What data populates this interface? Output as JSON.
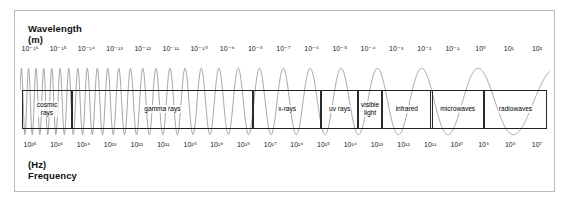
{
  "figure": {
    "background_color": "#ffffff",
    "frame_color": "#b9b9b9",
    "line_color": "#222222",
    "wave_color": "#8a8a8a"
  },
  "wavelength_axis": {
    "title_line1": "Wavelength",
    "title_line2": "(m)",
    "unit": "m",
    "ticks": [
      "10⁻¹⁶",
      "10⁻¹⁵",
      "10⁻¹⁴",
      "10⁻¹³",
      "10⁻¹²",
      "10⁻¹¹",
      "10⁻¹⁰",
      "10⁻⁹",
      "10⁻⁸",
      "10⁻⁷",
      "10⁻⁶",
      "10⁻⁵",
      "10⁻⁴",
      "10⁻³",
      "10⁻²",
      "10⁻¹",
      "10⁰",
      "10¹",
      "10²"
    ],
    "exponents": [
      -16,
      -15,
      -14,
      -13,
      -12,
      -11,
      -10,
      -9,
      -8,
      -7,
      -6,
      -5,
      -4,
      -3,
      -2,
      -1,
      0,
      1,
      2
    ]
  },
  "frequency_axis": {
    "title_line1": "(Hz)",
    "title_line2": "Frequency",
    "unit": "Hz",
    "ticks": [
      "10²⁵",
      "10²⁶",
      "10²⁴",
      "10²³",
      "10²²",
      "10²¹",
      "10²⁰",
      "10¹⁹",
      "10¹⁸",
      "10¹⁷",
      "10¹⁶",
      "10¹⁵",
      "10¹⁴",
      "10¹³",
      "10¹²",
      "10¹¹",
      "10¹⁰",
      "10⁹",
      "10⁸",
      "10⁷"
    ],
    "exponents": [
      25,
      26,
      24,
      23,
      22,
      21,
      20,
      19,
      18,
      17,
      16,
      15,
      14,
      13,
      12,
      11,
      10,
      9,
      8,
      7
    ]
  },
  "bands": [
    {
      "name": "cosmic-rays",
      "label": "cosmic\nrays",
      "start_pct": 0.0,
      "end_pct": 9.5
    },
    {
      "name": "gamma-rays",
      "label": "gamma rays",
      "start_pct": 9.5,
      "end_pct": 44.0
    },
    {
      "name": "x-rays",
      "label": "x-rays",
      "start_pct": 44.0,
      "end_pct": 57.0
    },
    {
      "name": "uv-rays",
      "label": "uv rays",
      "start_pct": 57.0,
      "end_pct": 64.0
    },
    {
      "name": "visible-light",
      "label": "visible\nlight",
      "start_pct": 64.0,
      "end_pct": 68.6
    },
    {
      "name": "infrared",
      "label": "infrared",
      "start_pct": 68.6,
      "end_pct": 78.0
    },
    {
      "name": "microwaves",
      "label": "microwaves",
      "start_pct": 78.0,
      "end_pct": 88.0
    },
    {
      "name": "radiowaves",
      "label": "radiowaves",
      "start_pct": 88.0,
      "end_pct": 100.0
    }
  ]
}
